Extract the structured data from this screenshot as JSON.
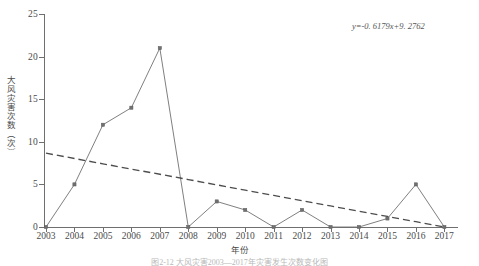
{
  "chart_data": {
    "type": "line",
    "title": "",
    "xlabel": "年份",
    "ylabel": "大风灾害次数（次）",
    "categories": [
      "2003",
      "2004",
      "2005",
      "2006",
      "2007",
      "2008",
      "2009",
      "2010",
      "2011",
      "2012",
      "2013",
      "2014",
      "2015",
      "2016",
      "2017"
    ],
    "series": [
      {
        "name": "大风灾害次数",
        "values": [
          0,
          5,
          12,
          14,
          21,
          0,
          3,
          2,
          0,
          2,
          0,
          0,
          1,
          5,
          0
        ],
        "style": "solid-with-square-markers",
        "color": "#707070"
      },
      {
        "name": "线性趋势线",
        "values": [
          8.66,
          8.04,
          7.42,
          6.8,
          6.19,
          5.57,
          4.95,
          4.33,
          3.71,
          3.09,
          2.47,
          1.86,
          1.24,
          0.62,
          0.0
        ],
        "style": "dashed",
        "color": "#4d4d4d"
      }
    ],
    "ylim": [
      0,
      25
    ],
    "yticks": [
      0,
      5,
      10,
      15,
      20,
      25
    ],
    "grid": false,
    "legend": "none",
    "annotations": [
      {
        "name": "trendline-equation",
        "text": "y=-0. 6179x+9. 2762"
      }
    ]
  },
  "caption": {
    "text": "图2-12  大风灾害2003—2017年灾害发生次数变化图"
  }
}
